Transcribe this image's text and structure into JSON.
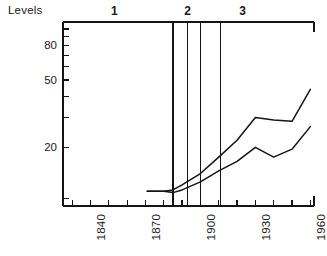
{
  "axis_title": "Levels",
  "chart_data": {
    "type": "line",
    "title": "",
    "xlabel": "",
    "ylabel": "Levels",
    "yscale": "log",
    "ylim": [
      9,
      110
    ],
    "xlim": [
      1825,
      1962
    ],
    "grid": false,
    "legend": "none",
    "y_ticks_labeled": [
      20,
      50,
      80
    ],
    "y_tick_labels": [
      "20",
      "50",
      "80"
    ],
    "x_ticks_labeled": [
      1840,
      1870,
      1900,
      1930,
      1960
    ],
    "x_tick_labels": [
      "1840",
      "1870",
      "1900",
      "1930",
      "1960"
    ],
    "x_minor_tick_step": 10,
    "series": [
      {
        "name": "upper-curve",
        "x": [
          1871,
          1880,
          1885,
          1890,
          1900,
          1910,
          1920,
          1930,
          1940,
          1950,
          1960
        ],
        "values": [
          11.0,
          11.0,
          11.2,
          12.0,
          14.0,
          17.5,
          22.0,
          30.0,
          29.0,
          28.5,
          44.0
        ]
      },
      {
        "name": "lower-curve",
        "x": [
          1871,
          1880,
          1885,
          1890,
          1900,
          1910,
          1920,
          1930,
          1940,
          1950,
          1960
        ],
        "values": [
          11.0,
          11.0,
          10.8,
          11.2,
          12.5,
          14.5,
          16.5,
          20.0,
          17.5,
          19.5,
          26.5
        ]
      }
    ],
    "period_markers": [
      {
        "label": "1",
        "center_year": 1853,
        "boundary_year": 1885
      },
      {
        "label": "2",
        "center_year": 1893,
        "boundary_year": 1893
      },
      {
        "label": "2b",
        "label_hidden": true,
        "boundary_year": 1900
      },
      {
        "label": "3",
        "center_year": 1923,
        "boundary_year": 1911
      }
    ],
    "period_labels": [
      "1",
      "2",
      "3"
    ],
    "vertical_divider_years": [
      1885,
      1893,
      1900,
      1911
    ],
    "annotations": []
  },
  "colors": {
    "line": "#141414",
    "axis": "#141414",
    "background": "#ffffff"
  }
}
